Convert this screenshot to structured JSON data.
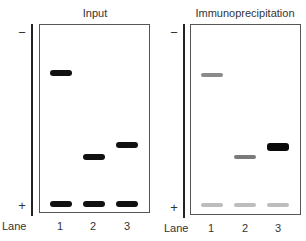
{
  "panels": [
    {
      "title": "Input",
      "minus_label": "−",
      "plus_label": "+",
      "bands": [
        {
          "lane": 1,
          "y": 73,
          "color": "#111111",
          "height": 6
        },
        {
          "lane": 1,
          "y": 204,
          "color": "#111111",
          "height": 6
        },
        {
          "lane": 2,
          "y": 157,
          "color": "#111111",
          "height": 6
        },
        {
          "lane": 2,
          "y": 204,
          "color": "#111111",
          "height": 6
        },
        {
          "lane": 3,
          "y": 145,
          "color": "#111111",
          "height": 6
        },
        {
          "lane": 3,
          "y": 204,
          "color": "#111111",
          "height": 6
        }
      ]
    },
    {
      "title": "Immunoprecipitation",
      "minus_label": "−",
      "plus_label": "+",
      "bands": [
        {
          "lane": 1,
          "y": 75,
          "color": "#8a8a8a",
          "height": 4
        },
        {
          "lane": 1,
          "y": 205,
          "color": "#bdbdbd",
          "height": 4
        },
        {
          "lane": 2,
          "y": 157,
          "color": "#7a7a7a",
          "height": 4
        },
        {
          "lane": 2,
          "y": 205,
          "color": "#bdbdbd",
          "height": 4
        },
        {
          "lane": 3,
          "y": 147,
          "color": "#0a0a0a",
          "height": 8
        },
        {
          "lane": 3,
          "y": 205,
          "color": "#bdbdbd",
          "height": 4
        }
      ]
    }
  ],
  "lane_axis_label": "Lane",
  "lanes": [
    "1",
    "2",
    "3"
  ]
}
